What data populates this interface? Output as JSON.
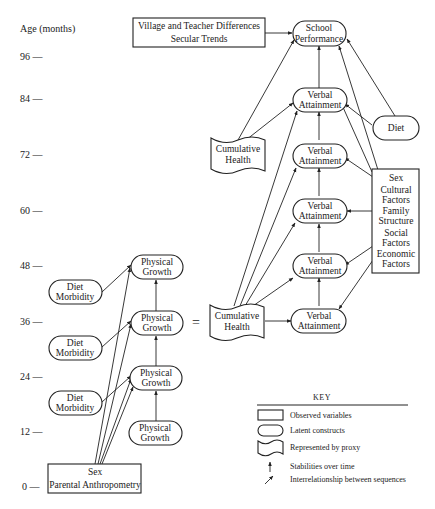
{
  "axis": {
    "label": "Age (months)",
    "ticks": [
      {
        "label": "96 —",
        "y": 57
      },
      {
        "label": "84 —",
        "y": 99
      },
      {
        "label": "72 —",
        "y": 155
      },
      {
        "label": "60 —",
        "y": 211
      },
      {
        "label": "48 —",
        "y": 266
      },
      {
        "label": "36 —",
        "y": 322
      },
      {
        "label": "24 —",
        "y": 377
      },
      {
        "label": "12 —",
        "y": 432
      },
      {
        "label": "0 —",
        "y": 487
      }
    ]
  },
  "nodes": {
    "village": {
      "line1": "Village and Teacher Differences",
      "line2": "Secular Trends"
    },
    "school": {
      "line1": "School",
      "line2": "Performance"
    },
    "verbal_84": {
      "line1": "Verbal",
      "line2": "Attainment"
    },
    "verbal_72": {
      "line1": "Verbal",
      "line2": "Attainment"
    },
    "verbal_60": {
      "line1": "Verbal",
      "line2": "Attainment"
    },
    "verbal_48": {
      "line1": "Verbal",
      "line2": "Attainment"
    },
    "verbal_36": {
      "line1": "Verbal",
      "line2": "Attainment"
    },
    "diet_top": {
      "line1": "Diet"
    },
    "cum_health_top": {
      "line1": "Cumulative",
      "line2": "Health"
    },
    "cum_health_36": {
      "line1": "Cumulative",
      "line2": "Health"
    },
    "equals": "=",
    "factors": {
      "lines": [
        "Sex",
        "Cultural",
        "Factors",
        "Family",
        "Structure",
        "Social",
        "Factors",
        "Economic",
        "Factors"
      ]
    },
    "physical_48": {
      "line1": "Physical",
      "line2": "Growth"
    },
    "physical_36": {
      "line1": "Physical",
      "line2": "Growth"
    },
    "physical_24": {
      "line1": "Physical",
      "line2": "Growth"
    },
    "physical_12": {
      "line1": "Physical",
      "line2": "Growth"
    },
    "diet_morb_42": {
      "line1": "Diet",
      "line2": "Morbidity"
    },
    "diet_morb_30": {
      "line1": "Diet",
      "line2": "Morbidity"
    },
    "diet_morb_18": {
      "line1": "Diet",
      "line2": "Morbidity"
    },
    "sex_parental": {
      "line1": "Sex",
      "line2": "Parental Anthropometry"
    }
  },
  "key": {
    "title": "KEY",
    "items": [
      {
        "shape": "rectangle",
        "label": "Observed variables"
      },
      {
        "shape": "rounded",
        "label": "Latent constructs"
      },
      {
        "shape": "wave",
        "label": "Represented by proxy"
      },
      {
        "shape": "vertical-arrow",
        "label": "Stabilities over time"
      },
      {
        "shape": "diagonal-arrow",
        "label": "Interrelationship between sequences"
      }
    ]
  }
}
